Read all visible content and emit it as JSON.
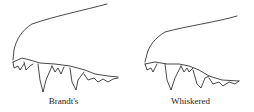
{
  "figures": [
    {
      "id": "brandts",
      "caption": "Brandt's",
      "subject": "upper-jaw-teeth-drawing"
    },
    {
      "id": "whiskered",
      "caption": "Whiskered",
      "subject": "upper-jaw-teeth-drawing"
    }
  ],
  "colors": {
    "line": "#1a1a1a",
    "background": "#ffffff"
  }
}
